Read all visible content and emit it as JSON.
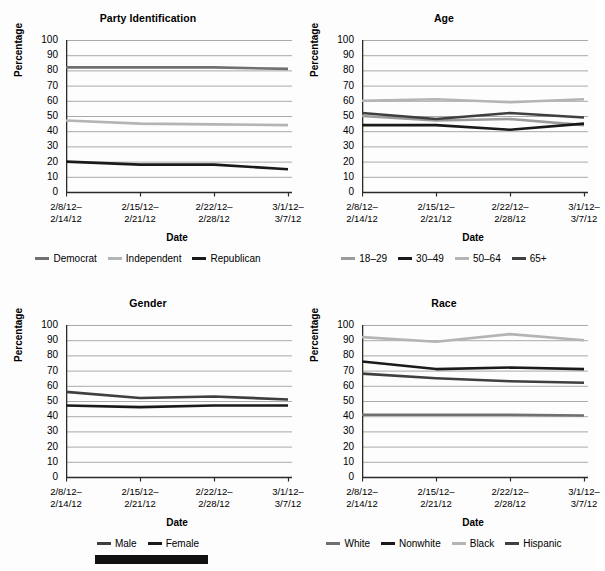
{
  "page": {
    "background": "#fdfdfd",
    "redaction_bar": {
      "present": true,
      "color": "#111111"
    }
  },
  "axis": {
    "ylabel": "Percentage",
    "xlabel": "Date",
    "yticks": [
      100,
      90,
      80,
      70,
      60,
      50,
      40,
      30,
      20,
      10,
      0
    ],
    "xticks": [
      {
        "line1": "2/8/12–",
        "line2": "2/14/12"
      },
      {
        "line1": "2/15/12–",
        "line2": "2/21/12"
      },
      {
        "line1": "2/22/12–",
        "line2": "2/28/12"
      },
      {
        "line1": "3/1/12–",
        "line2": "3/7/12"
      }
    ]
  },
  "colors": {
    "gridline": "#a9a9a9",
    "axis": "#2b2b2b",
    "dark": "#1a1a1a",
    "mid_dark": "#3f3f3f",
    "mid": "#707070",
    "light": "#9b9b9b",
    "lighter": "#b4b4b4"
  },
  "chart_data": [
    {
      "id": "party-identification",
      "type": "line",
      "title": "Party Identification",
      "xlabel": "Date",
      "ylabel": "Percentage",
      "ylim": [
        0,
        100
      ],
      "grid": true,
      "legend_position": "bottom",
      "categories": [
        "2/8/12–2/14/12",
        "2/15/12–2/21/12",
        "2/22/12–2/28/12",
        "3/1/12–3/7/12"
      ],
      "series": [
        {
          "name": "Democrat",
          "values": [
            82,
            82,
            82,
            81
          ],
          "color": "#707070"
        },
        {
          "name": "Independent",
          "values": [
            47,
            45,
            44.5,
            44
          ],
          "color": "#b4b4b4"
        },
        {
          "name": "Republican",
          "values": [
            20,
            18,
            18,
            15
          ],
          "color": "#1a1a1a"
        }
      ]
    },
    {
      "id": "age",
      "type": "line",
      "title": "Age",
      "xlabel": "Date",
      "ylabel": "Percentage",
      "ylim": [
        0,
        100
      ],
      "grid": true,
      "legend_position": "bottom",
      "categories": [
        "2/8/12–2/14/12",
        "2/15/12–2/21/12",
        "2/22/12–2/28/12",
        "3/1/12–3/7/12"
      ],
      "series": [
        {
          "name": "18–29",
          "values": [
            50,
            47,
            48,
            44
          ],
          "color": "#9b9b9b"
        },
        {
          "name": "30–49",
          "values": [
            44,
            44,
            41,
            45
          ],
          "color": "#1a1a1a"
        },
        {
          "name": "50–64",
          "values": [
            60,
            61,
            59,
            61
          ],
          "color": "#b4b4b4"
        },
        {
          "name": "65+",
          "values": [
            52,
            48,
            52,
            49
          ],
          "color": "#3f3f3f"
        }
      ]
    },
    {
      "id": "gender",
      "type": "line",
      "title": "Gender",
      "xlabel": "Date",
      "ylabel": "Percentage",
      "ylim": [
        0,
        100
      ],
      "grid": true,
      "legend_position": "bottom",
      "categories": [
        "2/8/12–2/14/12",
        "2/15/12–2/21/12",
        "2/22/12–2/28/12",
        "3/1/12–3/7/12"
      ],
      "series": [
        {
          "name": "Male",
          "values": [
            56,
            52,
            53,
            51
          ],
          "color": "#3f3f3f"
        },
        {
          "name": "Female",
          "values": [
            47,
            46,
            47,
            47
          ],
          "color": "#1a1a1a"
        }
      ]
    },
    {
      "id": "race",
      "type": "line",
      "title": "Race",
      "xlabel": "Date",
      "ylabel": "Percentage",
      "ylim": [
        0,
        100
      ],
      "grid": true,
      "legend_position": "bottom",
      "categories": [
        "2/8/12–2/14/12",
        "2/15/12–2/21/12",
        "2/22/12–2/28/12",
        "3/1/12–3/7/12"
      ],
      "series": [
        {
          "name": "White",
          "values": [
            41,
            41,
            41,
            40.5
          ],
          "color": "#707070"
        },
        {
          "name": "Nonwhite",
          "values": [
            76,
            71,
            72,
            71
          ],
          "color": "#1a1a1a"
        },
        {
          "name": "Black",
          "values": [
            92,
            89,
            94,
            90
          ],
          "color": "#b4b4b4"
        },
        {
          "name": "Hispanic",
          "values": [
            68,
            65,
            63,
            62
          ],
          "color": "#3f3f3f"
        }
      ]
    }
  ]
}
